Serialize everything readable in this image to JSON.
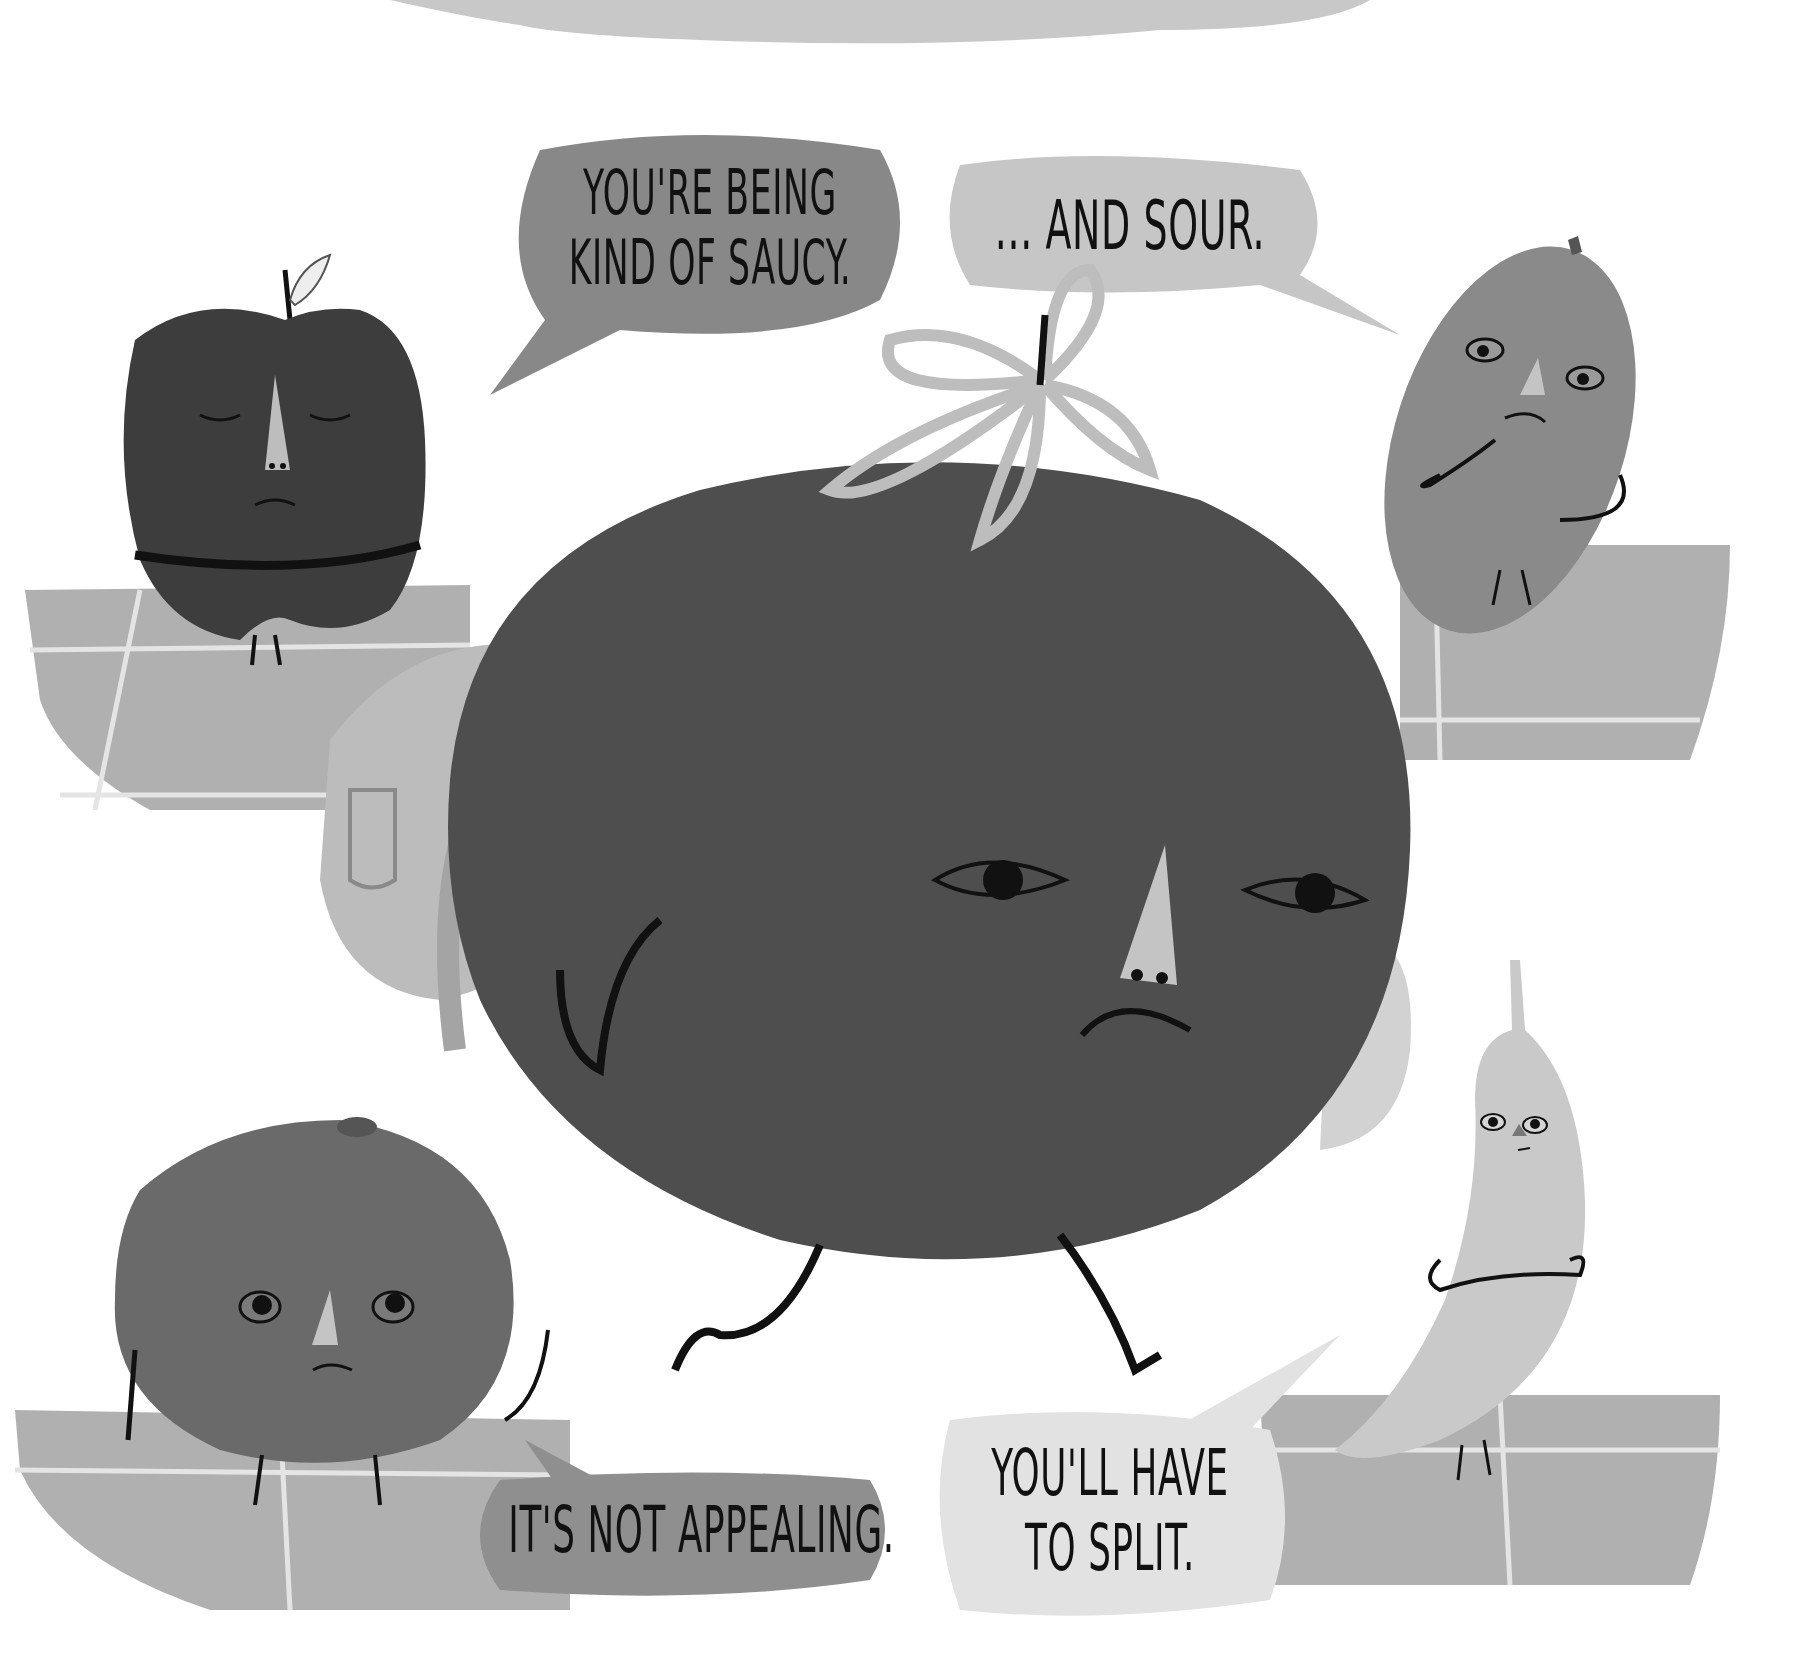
{
  "illustration": {
    "style": "grayscale picture-book painting",
    "colors": {
      "background": "#ffffff",
      "top_cloud": "#c8c8c8",
      "floor_tiles": "#b0b0b0",
      "tile_lines": "#e4e4e4",
      "tomato": "#4e4e4e",
      "apple": "#3d3d3d",
      "lemon": "#8a8a8a",
      "orange": "#6a6a6a",
      "banana": "#c9c9c9",
      "backpack": "#bcbcbc",
      "ink": "#111111"
    },
    "characters": [
      {
        "name": "tomato",
        "expression": "frown",
        "position": "center",
        "carrying": "backpack"
      },
      {
        "name": "apple",
        "expression": "eyes closed, arms crossed",
        "position": "top-left"
      },
      {
        "name": "lemon",
        "expression": "worried",
        "position": "top-right"
      },
      {
        "name": "orange",
        "expression": "frown",
        "position": "bottom-left"
      },
      {
        "name": "banana",
        "expression": "arms crossed",
        "position": "bottom-right"
      }
    ]
  },
  "speech_bubbles": {
    "saucy": {
      "line1": "YOU'RE BEING",
      "line2": "KIND OF SAUCY.",
      "fill": "#888888"
    },
    "sour": {
      "line1": "... AND SOUR.",
      "fill": "#c6c6c6"
    },
    "appealing": {
      "line1": "IT'S NOT APPEALING.",
      "fill": "#8f8f8f"
    },
    "split": {
      "line1": "YOU'LL HAVE",
      "line2": "TO SPLIT.",
      "fill": "#e2e2e2"
    }
  }
}
